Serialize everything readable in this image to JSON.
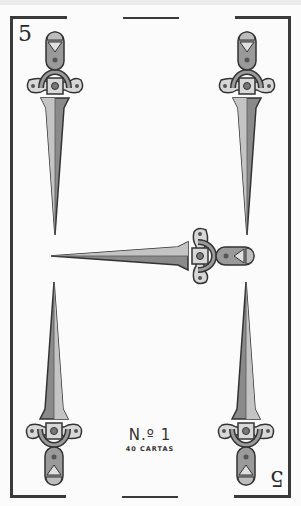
{
  "card": {
    "suit": "espadas",
    "rank_label": "5",
    "index_top": "5",
    "index_bottom": "5",
    "maker_number": "N.º 1",
    "maker_subtitle": "40 CARTAS",
    "pip_count": 5
  },
  "colors": {
    "background": "#ebebeb",
    "card": "#fbfbfb",
    "frame": "#3a3a3a",
    "blade_light": "#b9b9b9",
    "blade_dark": "#7a7a7a",
    "hilt": "#9a9a9a",
    "outline": "#333333"
  },
  "pips": [
    {
      "name": "dagger-top-left",
      "icon": "dagger-icon",
      "orientation": "point-down"
    },
    {
      "name": "dagger-top-right",
      "icon": "dagger-icon",
      "orientation": "point-down"
    },
    {
      "name": "dagger-center",
      "icon": "dagger-icon",
      "orientation": "point-left"
    },
    {
      "name": "dagger-bottom-left",
      "icon": "dagger-icon",
      "orientation": "point-up"
    },
    {
      "name": "dagger-bottom-right",
      "icon": "dagger-icon",
      "orientation": "point-up"
    }
  ]
}
